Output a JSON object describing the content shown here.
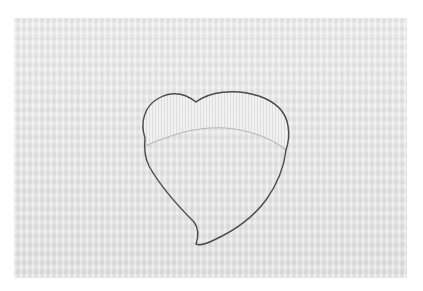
{
  "image": {
    "subject": "heart-shaped outline stitched on fabric",
    "colors": {
      "border": "#ffffff",
      "fabric": "#e4e4e4",
      "outline": "#4a4a4a",
      "cuff": "#f2f2f2"
    }
  }
}
